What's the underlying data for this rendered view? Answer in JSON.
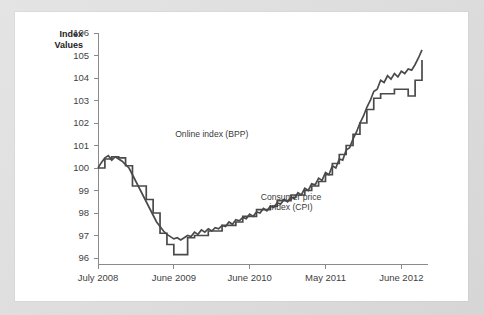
{
  "chart_data": {
    "type": "line",
    "title": "",
    "ylabel": "Index Values",
    "xlabel": "",
    "ylim": [
      96,
      106
    ],
    "yticks": [
      96,
      97,
      98,
      99,
      100,
      101,
      102,
      103,
      104,
      105,
      106
    ],
    "ytick_labels": [
      "96",
      "97",
      "98",
      "99",
      "100",
      "101",
      "102",
      "103",
      "104",
      "105",
      "106"
    ],
    "xticks": [
      0,
      11,
      22,
      33,
      44
    ],
    "xtick_labels": [
      "July 2008",
      "June 2009",
      "June 2010",
      "May 2011",
      "June 2012"
    ],
    "xlim": [
      0,
      47
    ],
    "grid": false,
    "legend_position": "inline-annotations",
    "annotations": [
      {
        "text": "Online index (BPP)",
        "x": 16.5,
        "y": 101.4
      },
      {
        "text": "Consumer price index (CPI)",
        "x": 28.0,
        "y": 98.6
      }
    ],
    "series": [
      {
        "name": "Online index (BPP)",
        "label": "Online index (BPP)",
        "color": "#4a4a4a",
        "style": "smooth",
        "x": [
          0,
          0.5,
          1,
          1.5,
          2,
          2.5,
          3,
          3.5,
          4,
          4.5,
          5,
          5.5,
          6,
          6.5,
          7,
          7.5,
          8,
          8.5,
          9,
          9.5,
          10,
          10.5,
          11,
          11.5,
          12,
          12.5,
          13,
          13.5,
          14,
          14.5,
          15,
          15.5,
          16,
          16.5,
          17,
          17.5,
          18,
          18.5,
          19,
          19.5,
          20,
          20.5,
          21,
          21.5,
          22,
          22.5,
          23,
          23.5,
          24,
          24.5,
          25,
          25.5,
          26,
          26.5,
          27,
          27.5,
          28,
          28.5,
          29,
          29.5,
          30,
          30.5,
          31,
          31.5,
          32,
          32.5,
          33,
          33.5,
          34,
          34.5,
          35,
          35.5,
          36,
          36.5,
          37,
          37.5,
          38,
          38.5,
          39,
          39.5,
          40,
          40.5,
          41,
          41.5,
          42,
          42.5,
          43,
          43.5,
          44,
          44.5,
          45,
          45.5,
          46,
          46.5,
          47
        ],
        "values": [
          100.0,
          100.25,
          100.45,
          100.55,
          100.35,
          100.5,
          100.4,
          100.3,
          100.15,
          100.0,
          99.7,
          99.4,
          99.1,
          98.8,
          98.5,
          98.2,
          97.9,
          97.6,
          97.4,
          97.2,
          97.05,
          96.95,
          96.85,
          96.9,
          96.8,
          96.9,
          97.0,
          96.95,
          97.15,
          97.05,
          97.25,
          97.15,
          97.3,
          97.2,
          97.35,
          97.3,
          97.45,
          97.4,
          97.6,
          97.5,
          97.7,
          97.65,
          97.8,
          97.75,
          97.95,
          97.85,
          98.05,
          98.0,
          98.2,
          98.1,
          98.3,
          98.25,
          98.45,
          98.4,
          98.6,
          98.5,
          98.7,
          98.65,
          98.9,
          98.8,
          99.1,
          99.0,
          99.3,
          99.25,
          99.55,
          99.45,
          99.8,
          99.7,
          100.1,
          100.0,
          100.4,
          100.35,
          100.8,
          100.9,
          101.3,
          101.6,
          102.0,
          102.3,
          102.7,
          103.0,
          103.4,
          103.5,
          103.9,
          103.8,
          104.1,
          103.95,
          104.2,
          104.05,
          104.3,
          104.2,
          104.4,
          104.35,
          104.6,
          104.9,
          105.25
        ],
        "values_note": "Online Billion Prices Project index, smooth daily-style line"
      },
      {
        "name": "Consumer price index (CPI)",
        "label": "Consumer price index (CPI)",
        "color": "#4a4a4a",
        "style": "stepped",
        "x": [
          0,
          1,
          2,
          3,
          4,
          5,
          6,
          7,
          8,
          9,
          10,
          11,
          12,
          13,
          14,
          15,
          16,
          17,
          18,
          19,
          20,
          21,
          22,
          23,
          24,
          25,
          26,
          27,
          28,
          29,
          30,
          31,
          32,
          33,
          34,
          35,
          36,
          37,
          38,
          39,
          40,
          41,
          42,
          43,
          44,
          45,
          46,
          47
        ],
        "values": [
          100.0,
          100.4,
          100.5,
          100.45,
          100.1,
          99.2,
          99.2,
          98.6,
          98.0,
          97.1,
          96.6,
          96.15,
          96.15,
          96.9,
          97.0,
          97.0,
          97.2,
          97.2,
          97.45,
          97.45,
          97.6,
          97.85,
          97.85,
          98.15,
          98.15,
          98.3,
          98.55,
          98.55,
          98.8,
          98.8,
          99.0,
          99.2,
          99.4,
          99.7,
          100.2,
          100.6,
          101.0,
          101.5,
          102.0,
          102.6,
          103.1,
          103.3,
          103.3,
          103.5,
          103.5,
          103.2,
          103.9,
          104.8
        ],
        "values_note": "Official consumer price index, monthly step function"
      }
    ]
  },
  "axis": {
    "y_title_line1": "Index",
    "y_title_line2": "Values"
  }
}
